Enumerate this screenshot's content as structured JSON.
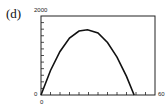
{
  "panel_label": "(d)",
  "chart_data": {
    "type": "line",
    "title": "",
    "xlabel": "",
    "ylabel": "",
    "xlim": [
      0,
      60
    ],
    "ylim": [
      0,
      2000
    ],
    "x_tick_labels": [
      "0",
      "60"
    ],
    "y_tick_labels": [
      "0",
      "2000"
    ],
    "x_minor_ticks": 12,
    "y_minor_ticks": 12,
    "grid": false,
    "legend": null,
    "series": [
      {
        "name": "curve",
        "color": "#111111",
        "x": [
          0,
          5,
          10,
          15,
          20,
          24.5,
          30,
          35,
          40,
          45,
          49
        ],
        "y": [
          0,
          620,
          1100,
          1440,
          1620,
          1650,
          1570,
          1330,
          960,
          470,
          0
        ]
      }
    ]
  }
}
